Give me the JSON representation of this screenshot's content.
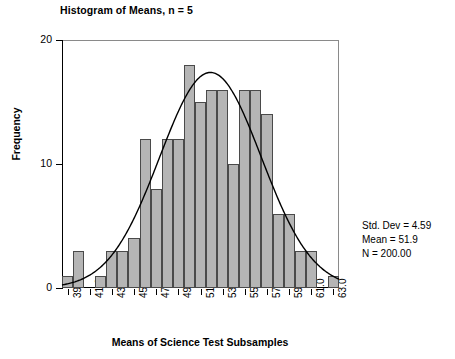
{
  "chart_data": {
    "type": "bar",
    "title": "Histogram of Means, n = 5",
    "xlabel": "Means of Science Test Subsamples",
    "ylabel": "Frequency",
    "grid": false,
    "legend": "none",
    "bin_width": 1,
    "bin_start": 38.5,
    "bin_end": 63.5,
    "xlim": [
      38.5,
      63.5
    ],
    "ylim": [
      0,
      20
    ],
    "ytick_labels": [
      "0",
      "10",
      "20"
    ],
    "ytick_values": [
      0,
      10,
      20
    ],
    "xtick_labels": [
      "39.0",
      "41.0",
      "43.0",
      "45.0",
      "47.0",
      "49.0",
      "51.0",
      "53.0",
      "55.0",
      "57.0",
      "59.0",
      "61.0",
      "63.0"
    ],
    "xtick_values": [
      39,
      41,
      43,
      45,
      47,
      49,
      51,
      53,
      55,
      57,
      59,
      61,
      63
    ],
    "bin_centers": [
      39,
      40,
      41,
      42,
      43,
      44,
      45,
      46,
      47,
      48,
      49,
      50,
      51,
      52,
      53,
      54,
      55,
      56,
      57,
      58,
      59,
      60,
      61,
      62,
      63
    ],
    "values": [
      1,
      3,
      0,
      1,
      3,
      3,
      4,
      12,
      8,
      12,
      12,
      18,
      15,
      16,
      16,
      10,
      16,
      16,
      14,
      6,
      6,
      3,
      3,
      0,
      1
    ],
    "overlay": {
      "type": "normal-curve",
      "mean": 51.9,
      "std_dev": 4.59,
      "n": 200,
      "color": "#000000"
    },
    "bar_fill": "#b5b5b5",
    "bar_edge": "#4a4a4a"
  },
  "stats": {
    "std_dev": "Std. Dev = 4.59",
    "mean": "Mean = 51.9",
    "n": "N = 200.00"
  }
}
